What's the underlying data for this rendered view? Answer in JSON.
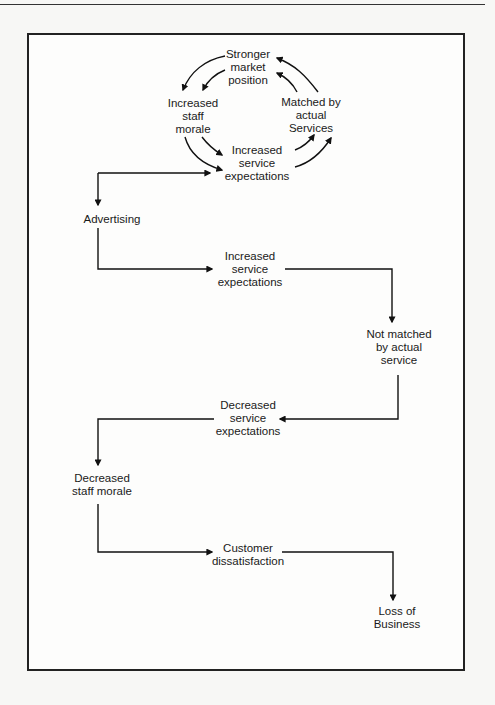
{
  "diagram": {
    "type": "flowchart",
    "cycle": {
      "nodes": [
        {
          "id": "stronger-market-position",
          "lines": [
            "Stronger",
            "market",
            "position"
          ]
        },
        {
          "id": "increased-staff-morale",
          "lines": [
            "Increased",
            "staff",
            "morale"
          ]
        },
        {
          "id": "matched-by-actual-services",
          "lines": [
            "Matched by",
            "actual",
            "Services"
          ]
        },
        {
          "id": "increased-service-expectations-cycle",
          "lines": [
            "Increased",
            "service",
            "expectations"
          ]
        }
      ],
      "edges": [
        {
          "from": "stronger-market-position",
          "to": "increased-staff-morale",
          "count": 2
        },
        {
          "from": "increased-staff-morale",
          "to": "increased-service-expectations-cycle",
          "count": 2
        },
        {
          "from": "increased-service-expectations-cycle",
          "to": "matched-by-actual-services",
          "count": 2
        },
        {
          "from": "matched-by-actual-services",
          "to": "stronger-market-position",
          "count": 2
        }
      ]
    },
    "flow": {
      "nodes": [
        {
          "id": "advertising",
          "lines": [
            "Advertising"
          ]
        },
        {
          "id": "increased-service-expectations",
          "lines": [
            "Increased",
            "service",
            "expectations"
          ]
        },
        {
          "id": "not-matched-by-actual-service",
          "lines": [
            "Not matched",
            "by actual",
            "service"
          ]
        },
        {
          "id": "decreased-service-expectations",
          "lines": [
            "Decreased",
            "service",
            "expectations"
          ]
        },
        {
          "id": "decreased-staff-morale",
          "lines": [
            "Decreased",
            "staff morale"
          ]
        },
        {
          "id": "customer-dissatisfaction",
          "lines": [
            "Customer",
            "dissatisfaction"
          ]
        },
        {
          "id": "loss-of-business",
          "lines": [
            "Loss of",
            "Business"
          ]
        }
      ],
      "edges": [
        {
          "from": "advertising",
          "to": "increased-service-expectations-cycle"
        },
        {
          "from": "increased-service-expectations-cycle",
          "to": "advertising"
        },
        {
          "from": "advertising",
          "to": "increased-service-expectations"
        },
        {
          "from": "increased-service-expectations",
          "to": "not-matched-by-actual-service"
        },
        {
          "from": "not-matched-by-actual-service",
          "to": "decreased-service-expectations"
        },
        {
          "from": "decreased-service-expectations",
          "to": "decreased-staff-morale"
        },
        {
          "from": "decreased-staff-morale",
          "to": "customer-dissatisfaction"
        },
        {
          "from": "customer-dissatisfaction",
          "to": "loss-of-business"
        }
      ]
    }
  }
}
